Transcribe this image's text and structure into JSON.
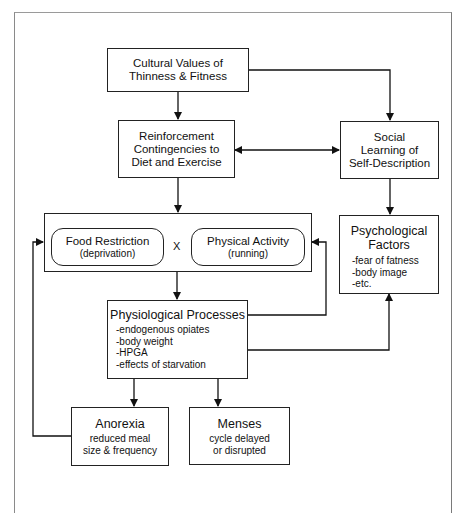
{
  "diagram": {
    "nodes": {
      "cultural": {
        "line1": "Cultural Values of",
        "line2": "Thinness & Fitness"
      },
      "reinforcement": {
        "line1": "Reinforcement",
        "line2": "Contingencies to",
        "line3": "Diet and Exercise"
      },
      "social": {
        "line1": "Social",
        "line2": "Learning of",
        "line3": "Self-Description"
      },
      "food_restriction": {
        "title": "Food Restriction",
        "subtitle": "(deprivation)"
      },
      "interaction_symbol": "X",
      "physical_activity": {
        "title": "Physical Activity",
        "subtitle": "(running)"
      },
      "psychological": {
        "line1": "Psychological",
        "line2": "Factors",
        "items": [
          "-fear of fatness",
          "-body image",
          "-etc."
        ]
      },
      "physiological": {
        "title": "Physiological Processes",
        "items": [
          "-endogenous opiates",
          "-body weight",
          "-HPGA",
          "-effects of starvation"
        ]
      },
      "anorexia": {
        "title": "Anorexia",
        "line1": "reduced meal",
        "line2": "size & frequency"
      },
      "menses": {
        "title": "Menses",
        "line1": "cycle delayed",
        "line2": "or disrupted"
      }
    },
    "edges": [
      {
        "from": "Cultural Values of Thinness & Fitness",
        "to": "Reinforcement Contingencies to Diet and Exercise"
      },
      {
        "from": "Cultural Values of Thinness & Fitness",
        "to": "Social Learning of Self-Description"
      },
      {
        "from": "Reinforcement Contingencies to Diet and Exercise",
        "to": "Social Learning of Self-Description",
        "bidirectional": true
      },
      {
        "from": "Reinforcement Contingencies to Diet and Exercise",
        "to": "Food Restriction X Physical Activity"
      },
      {
        "from": "Social Learning of Self-Description",
        "to": "Psychological Factors"
      },
      {
        "from": "Food Restriction X Physical Activity",
        "to": "Physiological Processes"
      },
      {
        "from": "Physiological Processes",
        "to": "Food Restriction X Physical Activity"
      },
      {
        "from": "Physiological Processes",
        "to": "Psychological Factors"
      },
      {
        "from": "Physiological Processes",
        "to": "Anorexia"
      },
      {
        "from": "Physiological Processes",
        "to": "Menses"
      },
      {
        "from": "Anorexia",
        "to": "Food Restriction X Physical Activity"
      }
    ]
  }
}
